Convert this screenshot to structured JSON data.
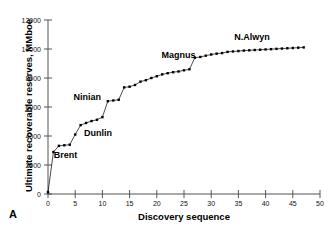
{
  "figure": {
    "panel_label": "A"
  },
  "chart_data": {
    "type": "line",
    "title": "",
    "xlabel": "Discovery sequence",
    "ylabel": "Ultimate recoverable reserves, MMboe",
    "xlim": [
      0,
      50
    ],
    "ylim": [
      0,
      12000
    ],
    "xticks": [
      0,
      5,
      10,
      15,
      20,
      25,
      30,
      35,
      40,
      45,
      50
    ],
    "yticks": [
      0,
      2000,
      4000,
      6000,
      8000,
      10000,
      12000
    ],
    "xtick_labels": [
      "0",
      "5",
      "10",
      "15",
      "20",
      "25",
      "30",
      "35",
      "40",
      "45",
      "50"
    ],
    "ytick_labels": [
      "0",
      "2000",
      "4000",
      "6000",
      "8000",
      "10000",
      "12000"
    ],
    "grid": false,
    "legend": "none",
    "marker": "filled-square",
    "line_color": "#000000",
    "x": [
      0,
      1,
      2,
      3,
      4,
      5,
      6,
      7,
      8,
      9,
      10,
      11,
      12,
      13,
      14,
      15,
      16,
      17,
      18,
      19,
      20,
      21,
      22,
      23,
      24,
      25,
      26,
      27,
      28,
      29,
      30,
      31,
      32,
      33,
      34,
      35,
      36,
      37,
      38,
      39,
      40,
      41,
      42,
      43,
      44,
      45,
      46,
      47
    ],
    "values": [
      120,
      2900,
      3320,
      3360,
      3400,
      4100,
      4750,
      4900,
      5030,
      5120,
      5300,
      6400,
      6450,
      6500,
      7350,
      7400,
      7520,
      7750,
      7850,
      8000,
      8120,
      8250,
      8330,
      8400,
      8450,
      8530,
      8600,
      9400,
      9450,
      9540,
      9620,
      9680,
      9720,
      9800,
      9830,
      9860,
      9890,
      9910,
      9930,
      9950,
      9970,
      9990,
      10010,
      10030,
      10050,
      10070,
      10090,
      10110
    ],
    "annotations": [
      {
        "text": "Brent",
        "x": 3.2,
        "y": 2450
      },
      {
        "text": "Dunlin",
        "x": 9.2,
        "y": 4000
      },
      {
        "text": "Ninian",
        "x": 7.2,
        "y": 6450
      },
      {
        "text": "Magnus",
        "x": 24.0,
        "y": 9350
      },
      {
        "text": "N.Alwyn",
        "x": 37.5,
        "y": 10620
      }
    ]
  }
}
